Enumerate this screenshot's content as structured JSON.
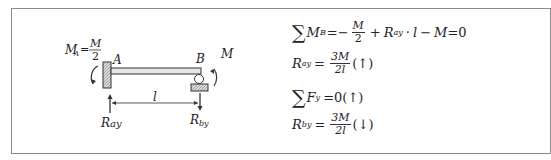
{
  "corner_label": "",
  "diagram": {
    "moment_A_label": "M",
    "moment_A_sub": "A",
    "moment_A_value_num": "M",
    "moment_A_value_den": "2",
    "point_A": "A",
    "point_B": "B",
    "moment_B_label": "M",
    "span_label": "l",
    "reaction_A": "R",
    "reaction_A_sub": "ay",
    "reaction_B": "R",
    "reaction_B_sub": "by",
    "colors": {
      "line": "#333333",
      "hatch": "#9a9a9a",
      "beam": "#e6e6e6"
    }
  },
  "equations": [
    {
      "id": "sum_MB",
      "sigma": "∑",
      "lhs": "M",
      "lhs_sub": "B",
      "eq": "=−",
      "frac_num": "M",
      "frac_den": "2",
      "plus": "+",
      "term": "R",
      "term_sub": "ay",
      "dot": "·",
      "l": "l",
      "minus": "−",
      "M": "M",
      "rhs": "=0"
    },
    {
      "id": "R_ay",
      "lhs": "R",
      "lhs_sub": "ay",
      "eq": "=",
      "frac_num": "3M",
      "frac_den": "2l",
      "dir": "(↑)"
    },
    {
      "id": "sum_Fy",
      "sigma": "∑",
      "lhs": "F",
      "lhs_sub": "y",
      "rhs": "=0",
      "dir": "(↑)"
    },
    {
      "id": "R_by",
      "lhs": "R",
      "lhs_sub": "by",
      "eq": "=",
      "frac_num": "3M",
      "frac_den": "2l",
      "dir": "(↓)"
    }
  ]
}
